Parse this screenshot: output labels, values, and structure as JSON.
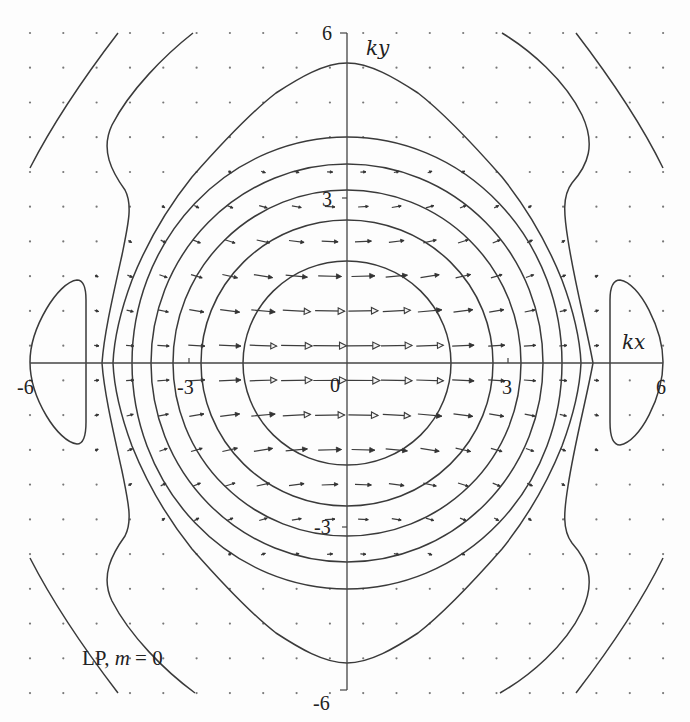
{
  "chart_data": {
    "type": "contour+vector",
    "title": "",
    "annotation": "LP, m = 0",
    "xlabel": "kx",
    "ylabel": "ky",
    "xlim": [
      -6,
      6
    ],
    "ylim": [
      -6,
      6
    ],
    "grid": false,
    "legend": null,
    "x_tick_labels": [
      "-6",
      "-3",
      "0",
      "3",
      "6"
    ],
    "y_tick_labels": [
      "6",
      "3",
      "-3",
      "-6"
    ],
    "origin_label": "0",
    "frame": {
      "x_min_px": 30,
      "x_max_px": 663,
      "y_min_px": 33,
      "y_max_px": 693,
      "origin_px": [
        347,
        363
      ]
    },
    "contours": [
      {
        "name": "level-1",
        "shape": "ellipse",
        "rx_units": 1.97,
        "ry_units": 1.85
      },
      {
        "name": "level-2",
        "shape": "ellipse",
        "rx_units": 2.77,
        "ry_units": 2.6
      },
      {
        "name": "level-3",
        "shape": "ellipse",
        "rx_units": 3.3,
        "ry_units": 3.15
      },
      {
        "name": "level-4",
        "shape": "ellipse",
        "rx_units": 3.72,
        "ry_units": 3.62
      },
      {
        "name": "level-5",
        "shape": "ellipse",
        "rx_units": 4.08,
        "ry_units": 4.1
      },
      {
        "name": "level-6",
        "shape": "bulged",
        "x_axis_cross_units": 4.4,
        "y_axis_cross_units": 5.45
      },
      {
        "name": "level-7",
        "shape": "wiggly-open",
        "x_axis_cross_units": 4.65,
        "exits_top_at_kx": [
          -2.9,
          2.95
        ]
      },
      {
        "name": "level-8",
        "shape": "outer-arcs",
        "rx_units": 6.7,
        "ry_units": 7.8
      },
      {
        "name": "side-lobes",
        "shape": "closed-blobs",
        "kx_range": [
          [
            -6,
            -4.95
          ],
          [
            4.95,
            6
          ]
        ],
        "ky_range": [
          -1.5,
          1.5
        ]
      }
    ],
    "contour_paths": {
      "c1": "M243,363 A104,102 0 1,0 451,363 A104,102 0 1,0 243,363 Z",
      "c2": "M201,363 A146,143 0 1,0 493,363 A146,143 0 1,0 201,363 Z",
      "c3": "M173,363 A174,173 0 1,0 521,363 A174,173 0 1,0 173,363 Z",
      "c4": "M151,363 A196,199 0 1,0 543,363 A196,199 0 1,0 151,363 Z",
      "c5": "M132,363 A215,226 0 1,0 562,363 A215,226 0 1,0 132,363 Z",
      "c6": "M347,63 C370,63 395,78 418,93 C440,110 465,135 502,177 C530,212 550,250 562,280 C575,315 580,340 581,363 C580,386 575,411 562,446 C550,476 530,514 502,549 C465,591 440,616 418,633 C395,648 370,663 347,663 C324,663 299,648 276,633 C254,616 229,591 192,549 C164,514 144,476 132,446 C119,411 114,386 113,363 C114,340 119,315 132,280 C144,250 164,212 192,177 C229,135 254,110 276,93 C299,78 324,63 347,63 Z",
      "c7_left": "M193,33 C165,55 130,90 112,125 C100,150 112,172 125,190 C133,205 128,225 122,255 C112,300 104,335 102,363 C104,391 112,426 122,471 C128,501 133,521 125,536 C112,554 100,576 112,601 C130,636 165,671 195,693",
      "c7_right": "M502,33 C530,50 565,80 582,115 C596,145 588,165 572,183 C562,196 564,215 568,240 C575,285 586,325 593,363 C586,401 575,441 568,486 C564,511 562,530 572,543 C588,561 596,581 582,611 C565,646 530,676 500,693",
      "c8_left": "M118,33 C82,80 52,125 30,168",
      "c8_left_bottom": "M30,558 C52,601 82,646 118,693",
      "c8_right": "M576,33 C612,80 642,125 663,168",
      "c8_right_bottom": "M663,558 C642,601 612,646 576,693",
      "blob_left": "M86,300 C86,287 83,280 77,280 C58,282 30,328 30,362 C30,398 58,442 77,444 C83,444 86,436 86,422 Z",
      "blob_right": "M610,300 C610,287 613,280 620,280 C640,283 663,330 663,362 C663,396 640,442 620,445 C613,445 610,436 610,422 Z"
    },
    "vector_field": {
      "grid_cols": 20,
      "grid_rows": 20,
      "x0_px": 30,
      "dx_px": 33.32,
      "y0_px": 33,
      "dy_px": 34.74,
      "k_step": 0.6316,
      "direction": "+kx",
      "max_length_px": 34,
      "decay_kx_units": 3.4,
      "decay_ky_units": 2.6,
      "tilt_deg_per_unit2": 3.5,
      "open_head_threshold_px": 26,
      "dot_threshold_px": 3
    }
  },
  "labels": {
    "ky": "ky",
    "kx": "kx",
    "y_top": "6",
    "y_3": "3",
    "y_m3": "-3",
    "y_m6": "-6",
    "x_m6": "-6",
    "x_m3": "-3",
    "x_0": "0",
    "x_3": "3",
    "x_6": "6",
    "caption_lp": "LP, ",
    "caption_m": "m",
    "caption_eq": " = 0"
  }
}
